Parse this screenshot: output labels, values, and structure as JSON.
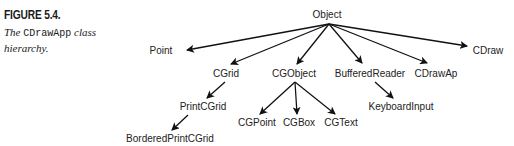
{
  "caption": {
    "label": "FIGURE 5.4.",
    "desc_before": "The ",
    "desc_code": "CDrawApp",
    "desc_after": " class hierarchy."
  },
  "nodes": {
    "object": "Object",
    "point": "Point",
    "cgrid": "CGrid",
    "cgobject": "CGObject",
    "bufferedreader": "BufferedReader",
    "cdrawap": "CDrawAp",
    "cdraw": "CDraw",
    "printcgrid": "PrintCGrid",
    "keyboardinput": "KeyboardInput",
    "borderedprintcgrid": "BorderedPrintCGrid",
    "cgpoint": "CGPoint",
    "cgbox": "CGBox",
    "cgtext": "CGText"
  },
  "colors": {
    "line": "#111111",
    "text": "#222222"
  }
}
